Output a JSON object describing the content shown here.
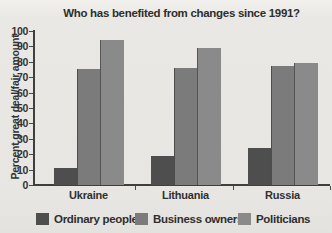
{
  "chart_data": {
    "type": "bar",
    "title": "Who has benefited from changes since 1991?",
    "ylabel": "Percent great deal/fair amount",
    "xlabel": "",
    "categories": [
      "Ukraine",
      "Lithuania",
      "Russia"
    ],
    "series": [
      {
        "name": "Ordinary people",
        "color": "#4e4e4e",
        "values": [
          11,
          19,
          24
        ]
      },
      {
        "name": "Business owners",
        "color": "#7b7b7b",
        "values": [
          75,
          76,
          77
        ]
      },
      {
        "name": "Politicians",
        "color": "#8a8a8a",
        "values": [
          94,
          89,
          79
        ]
      }
    ],
    "ylim": [
      0,
      100
    ],
    "yticks": [
      0,
      10,
      20,
      30,
      40,
      50,
      60,
      70,
      80,
      90,
      100
    ],
    "grid": false,
    "legend_position": "bottom"
  },
  "colors": {
    "background": "#e7e6e2",
    "axis": "#3f3f3f",
    "text": "#2e2e2e"
  }
}
